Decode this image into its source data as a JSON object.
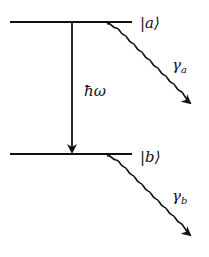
{
  "diagram": {
    "levels": [
      {
        "id": "a",
        "label": "|a⟩",
        "decay_label": "γ",
        "decay_sub": "a"
      },
      {
        "id": "b",
        "label": "|b⟩",
        "decay_label": "γ",
        "decay_sub": "b"
      }
    ],
    "transition_label": "ħω",
    "colors": {
      "line": "#111111",
      "background": "#ffffff"
    }
  }
}
